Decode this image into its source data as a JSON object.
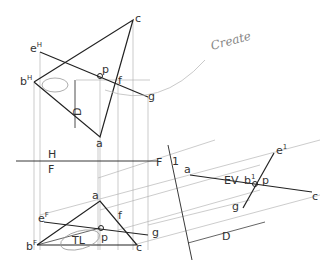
{
  "diagram": {
    "type": "descriptive-geometry-piercing-point",
    "annotation_handwritten": "Create",
    "views": {
      "top": {
        "labels": {
          "b": "b",
          "b_sup": "H",
          "e": "e",
          "e_sup": "H",
          "c": "c",
          "a": "a",
          "p": "p",
          "f": "f",
          "g": "g",
          "D": "D"
        }
      },
      "fold_hf": {
        "top": "H",
        "bottom": "F"
      },
      "front": {
        "labels": {
          "a": "a",
          "b": "b",
          "b_sup": "F",
          "e": "e",
          "e_sup": "F",
          "c": "c",
          "f": "f",
          "g": "g",
          "p": "p",
          "TL": "TL"
        }
      },
      "fold_f1": {
        "left": "F",
        "right": "1"
      },
      "aux": {
        "labels": {
          "a": "a",
          "EV": "EV",
          "b": "b",
          "b_sup": "1",
          "p": "p",
          "e": "e",
          "e_sup": "1",
          "g": "g",
          "c": "c",
          "D": "D"
        }
      }
    }
  }
}
